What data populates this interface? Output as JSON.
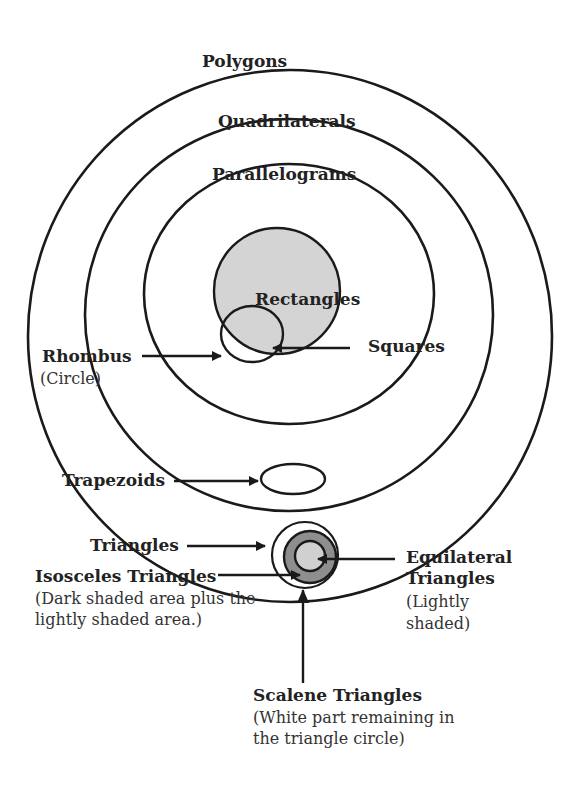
{
  "diagram": {
    "colors": {
      "stroke": "#1a1a1a",
      "rectangles_fill": "#d4d4d4",
      "isosceles_dark_fill": "#8e8e8e",
      "equilateral_light_fill": "#d0d0d0",
      "background": "#ffffff"
    },
    "sets": {
      "polygons": {
        "label": "Polygons"
      },
      "quadrilaterals": {
        "label": "Quadrilaterals"
      },
      "parallelograms": {
        "label": "Parallelograms"
      },
      "rectangles": {
        "label": "Rectangles"
      },
      "squares": {
        "label": "Squares"
      },
      "rhombus": {
        "label": "Rhombus",
        "note": "(Circle)"
      },
      "trapezoids": {
        "label": "Trapezoids"
      },
      "triangles": {
        "label": "Triangles"
      },
      "isosceles": {
        "label": "Isosceles Triangles",
        "note_line1": "(Dark shaded area plus the",
        "note_line2": "lightly shaded area.)"
      },
      "equilateral": {
        "label_line1": "Equilateral",
        "label_line2": "Triangles",
        "note_line1": "(Lightly",
        "note_line2": "shaded)"
      },
      "scalene": {
        "label": "Scalene Triangles",
        "note_line1": "(White part remaining in",
        "note_line2": "the triangle circle)"
      }
    }
  }
}
